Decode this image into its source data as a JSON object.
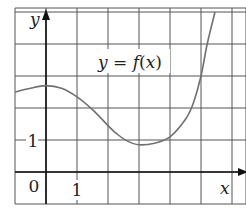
{
  "chart_data": {
    "type": "line",
    "title": "",
    "function_label": "y = f(x)",
    "xlabel": "x",
    "ylabel": "y",
    "xlim": [
      -1,
      6
    ],
    "ylim": [
      -1,
      5
    ],
    "grid": true,
    "grid_spacing": 1,
    "tick_labels": {
      "origin": "0",
      "x": [
        "1"
      ],
      "y": [
        "1"
      ]
    },
    "series": [
      {
        "name": "f(x)",
        "x": [
          -1,
          -0.5,
          0,
          0.5,
          1,
          1.5,
          2,
          2.3,
          2.6,
          3,
          3.5,
          4,
          4.5,
          4.75,
          5,
          5.2,
          5.45
        ],
        "y": [
          2.5,
          2.62,
          2.7,
          2.62,
          2.35,
          1.95,
          1.45,
          1.18,
          0.98,
          0.85,
          0.9,
          1.1,
          1.65,
          2.15,
          3.0,
          4.0,
          5.0
        ]
      }
    ],
    "colors": {
      "curve": "#707070",
      "grid": "#555555",
      "axes": "#111111"
    }
  },
  "labels": {
    "function": "y = f(x)",
    "x_axis": "x",
    "y_axis": "y",
    "origin": "0",
    "x_tick_1": "1",
    "y_tick_1": "1"
  }
}
